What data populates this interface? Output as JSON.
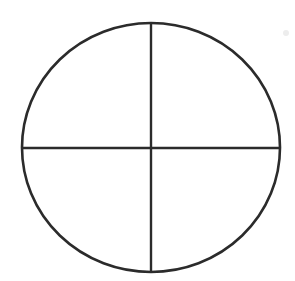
{
  "figure": {
    "canvas": {
      "width": 295,
      "height": 281,
      "background_color": "#ffffff"
    },
    "palette": {
      "ink": "#2b2b2b",
      "ink_soft": "#3a3a3a",
      "background": "#ffffff",
      "artifact": "#e8e8e8"
    },
    "shapes": {
      "circle": {
        "name": "outer-circle",
        "center_x": 151,
        "center_y": 147.5,
        "radius_x": 129,
        "radius_y": 124.5,
        "stroke_color": "#2b2b2b",
        "stroke_width": 2.6
      },
      "vertical_diameter": {
        "name": "vertical-divider",
        "x1": 151,
        "y1": 23,
        "x2": 151,
        "y2": 272,
        "stroke_color": "#2b2b2b",
        "stroke_width": 2.4
      },
      "horizontal_diameter": {
        "name": "horizontal-divider",
        "x1": 22,
        "y1": 148,
        "x2": 280,
        "y2": 148,
        "stroke_color": "#2b2b2b",
        "stroke_width": 2.4
      },
      "artifact_speck": {
        "name": "scan-speck",
        "center_x": 286,
        "center_y": 33,
        "radius": 3,
        "fill_color": "#ededed"
      }
    },
    "quadrants": [
      {
        "name": "top-left",
        "label": ""
      },
      {
        "name": "top-right",
        "label": ""
      },
      {
        "name": "bottom-left",
        "label": ""
      },
      {
        "name": "bottom-right",
        "label": ""
      }
    ]
  }
}
